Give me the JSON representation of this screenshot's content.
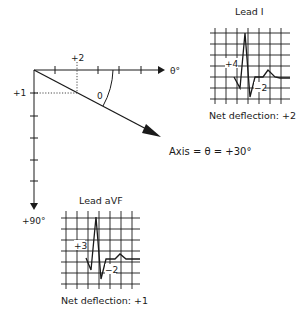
{
  "diagram": {
    "axes": {
      "horizontal_label": "θ°",
      "vertical_label": "+90°",
      "x_marker_label": "+2",
      "y_marker_label": "+1",
      "angle_label": "0"
    },
    "axis_equation": "Axis = θ = +30°",
    "lead_i": {
      "title": "Lead I",
      "positive_label": "+4",
      "negative_label": "−2",
      "net_deflection": "Net deflection: +2"
    },
    "lead_avf": {
      "title": "Lead aVF",
      "positive_label": "+3",
      "negative_label": "−2",
      "net_deflection": "Net deflection: +1"
    },
    "colors": {
      "ink": "#1a1a1a",
      "background": "#ffffff"
    }
  }
}
